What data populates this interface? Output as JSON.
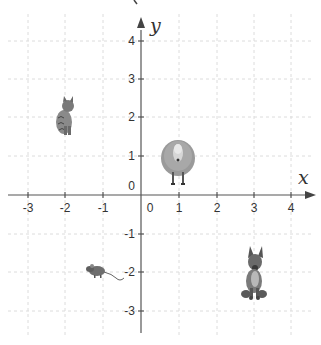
{
  "diagram": {
    "type": "coordinate-plane",
    "origin_px": [
      141,
      195
    ],
    "unit_px": [
      37.7,
      38.5
    ],
    "x_range": [
      -3.5,
      4.6
    ],
    "y_range": [
      -3.6,
      4.7
    ],
    "axes": {
      "x_label": "x",
      "y_label": "y",
      "x_ticks": [
        "-3",
        "-2",
        "-1",
        "0",
        "1",
        "2",
        "3",
        "4"
      ],
      "y_ticks": [
        "4",
        "3",
        "2",
        "1",
        "0",
        "-1",
        "-2",
        "-3"
      ]
    },
    "grid": {
      "style": "dashed",
      "color": "#d8d8d8"
    },
    "colors": {
      "axis": "#555555",
      "text": "#333333"
    },
    "animals": [
      {
        "name": "cat",
        "x": -2,
        "y": 1.9
      },
      {
        "name": "sheep",
        "x": 1,
        "y": 0.8
      },
      {
        "name": "mouse",
        "x": -1.2,
        "y": -2.1
      },
      {
        "name": "dog",
        "x": 3,
        "y": -2.2
      }
    ]
  }
}
